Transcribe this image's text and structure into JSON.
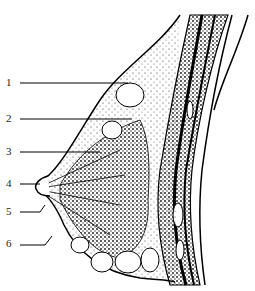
{
  "diagram": {
    "labels": [
      {
        "num": "1",
        "x": 6,
        "y": 77
      },
      {
        "num": "2",
        "x": 6,
        "y": 113
      },
      {
        "num": "3",
        "x": 6,
        "y": 146
      },
      {
        "num": "4",
        "x": 6,
        "y": 178
      },
      {
        "num": "5",
        "x": 6,
        "y": 206
      },
      {
        "num": "6",
        "x": 6,
        "y": 238
      }
    ]
  }
}
